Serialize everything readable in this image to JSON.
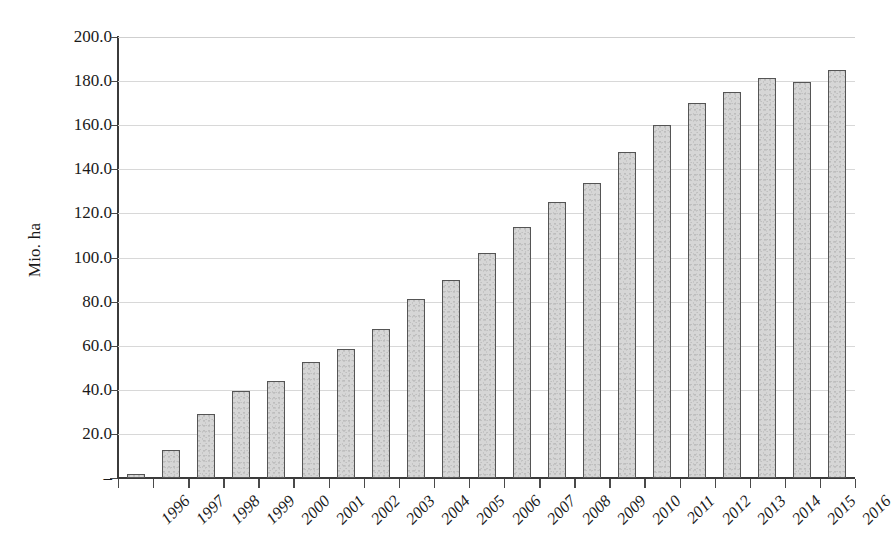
{
  "chart_data": {
    "type": "bar",
    "title": "",
    "subtitle": "",
    "xlabel": "",
    "ylabel": "Mio. ha",
    "ylim": [
      0,
      200
    ],
    "xlim_categories": 21,
    "grid": true,
    "legend": null,
    "y_ticks": [
      "–",
      "20.0",
      "40.0",
      "60.0",
      "80.0",
      "100.0",
      "120.0",
      "140.0",
      "160.0",
      "180.0",
      "200.0"
    ],
    "y_tick_values": [
      0,
      20,
      40,
      60,
      80,
      100,
      120,
      140,
      160,
      180,
      200
    ],
    "categories": [
      "1996",
      "1997",
      "1998",
      "1999",
      "2000",
      "2001",
      "2002",
      "2003",
      "2004",
      "2005",
      "2006",
      "2007",
      "2008",
      "2009",
      "2010",
      "2011",
      "2012",
      "2013",
      "2014",
      "2015",
      "2016"
    ],
    "values": [
      1.7,
      12.8,
      29.0,
      39.5,
      44.2,
      52.5,
      58.7,
      67.6,
      81.0,
      90.0,
      102.0,
      114.0,
      125.0,
      134.0,
      148.0,
      160.0,
      170.1,
      175.2,
      181.5,
      179.7,
      185.1
    ],
    "bar_color": "#d6d6d6",
    "bar_border_color": "#555555",
    "grid_color": "#d8d8d8",
    "axis_color": "#3b3b3b",
    "background_color": "#ffffff"
  }
}
